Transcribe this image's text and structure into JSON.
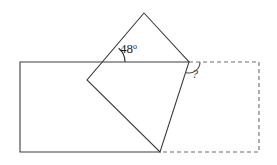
{
  "figure": {
    "canvas": {
      "width": 277,
      "height": 165,
      "background": "#ffffff"
    },
    "colors": {
      "stroke_solid": "#3c3c3c",
      "stroke_dashed": "#6e6e6e",
      "label": "#1a1a1a",
      "background": "#ffffff"
    },
    "labels": {
      "angle_known_value": "48",
      "angle_known_degree_symbol": "o",
      "angle_unknown_value": "?"
    },
    "shapes": {
      "rectangle_solid": {
        "name": "solid-rectangle",
        "left": 20,
        "top": 62,
        "right": 189,
        "bottom": 152,
        "style": "solid"
      },
      "rectangle_dashed": {
        "name": "dashed-rectangle-extension",
        "left": 189,
        "top": 62,
        "right": 259,
        "bottom": 152,
        "style": "dashed",
        "dash_pattern": "4,3"
      },
      "square_rotated": {
        "name": "rotated-square",
        "vertices": [
          {
            "label": "top",
            "x": 144,
            "y": 13
          },
          {
            "label": "right",
            "x": 189,
            "y": 62
          },
          {
            "label": "bottom",
            "x": 160,
            "y": 152
          },
          {
            "label": "left",
            "x": 87,
            "y": 80
          }
        ],
        "style": "solid"
      }
    },
    "annotations": {
      "angle_known": {
        "name": "angle-48-degrees",
        "vertex_x": 107,
        "vertex_y": 62,
        "arc_radius": 18,
        "text_x": 120,
        "text_y": 53
      },
      "angle_unknown": {
        "name": "angle-unknown",
        "vertex_x": 189,
        "vertex_y": 62,
        "arc_radius": 11,
        "text_x": 192,
        "text_y": 78
      }
    }
  },
  "chart_data": {
    "type": "diagram",
    "elements": [
      {
        "kind": "rectangle",
        "name": "base-rectangle",
        "segments": [
          {
            "style": "solid",
            "from": [
              20,
              62
            ],
            "to": [
              189,
              62
            ]
          },
          {
            "style": "dashed",
            "from": [
              189,
              62
            ],
            "to": [
              259,
              62
            ]
          },
          {
            "style": "dashed",
            "from": [
              259,
              62
            ],
            "to": [
              259,
              152
            ]
          },
          {
            "style": "dashed",
            "from": [
              259,
              152
            ],
            "to": [
              160,
              152
            ]
          },
          {
            "style": "solid",
            "from": [
              160,
              152
            ],
            "to": [
              20,
              152
            ]
          },
          {
            "style": "solid",
            "from": [
              20,
              152
            ],
            "to": [
              20,
              62
            ]
          }
        ]
      },
      {
        "kind": "square",
        "name": "rotated-square",
        "rotation_deg": 48,
        "vertices": [
          [
            144,
            13
          ],
          [
            189,
            62
          ],
          [
            160,
            152
          ],
          [
            87,
            80
          ]
        ]
      }
    ],
    "angles": [
      {
        "name": "known-angle",
        "value": 48,
        "unit": "degrees",
        "at": [
          107,
          62
        ],
        "label": "48o"
      },
      {
        "name": "unknown-angle",
        "value": null,
        "unit": "degrees",
        "at": [
          189,
          62
        ],
        "label": "?"
      }
    ]
  }
}
